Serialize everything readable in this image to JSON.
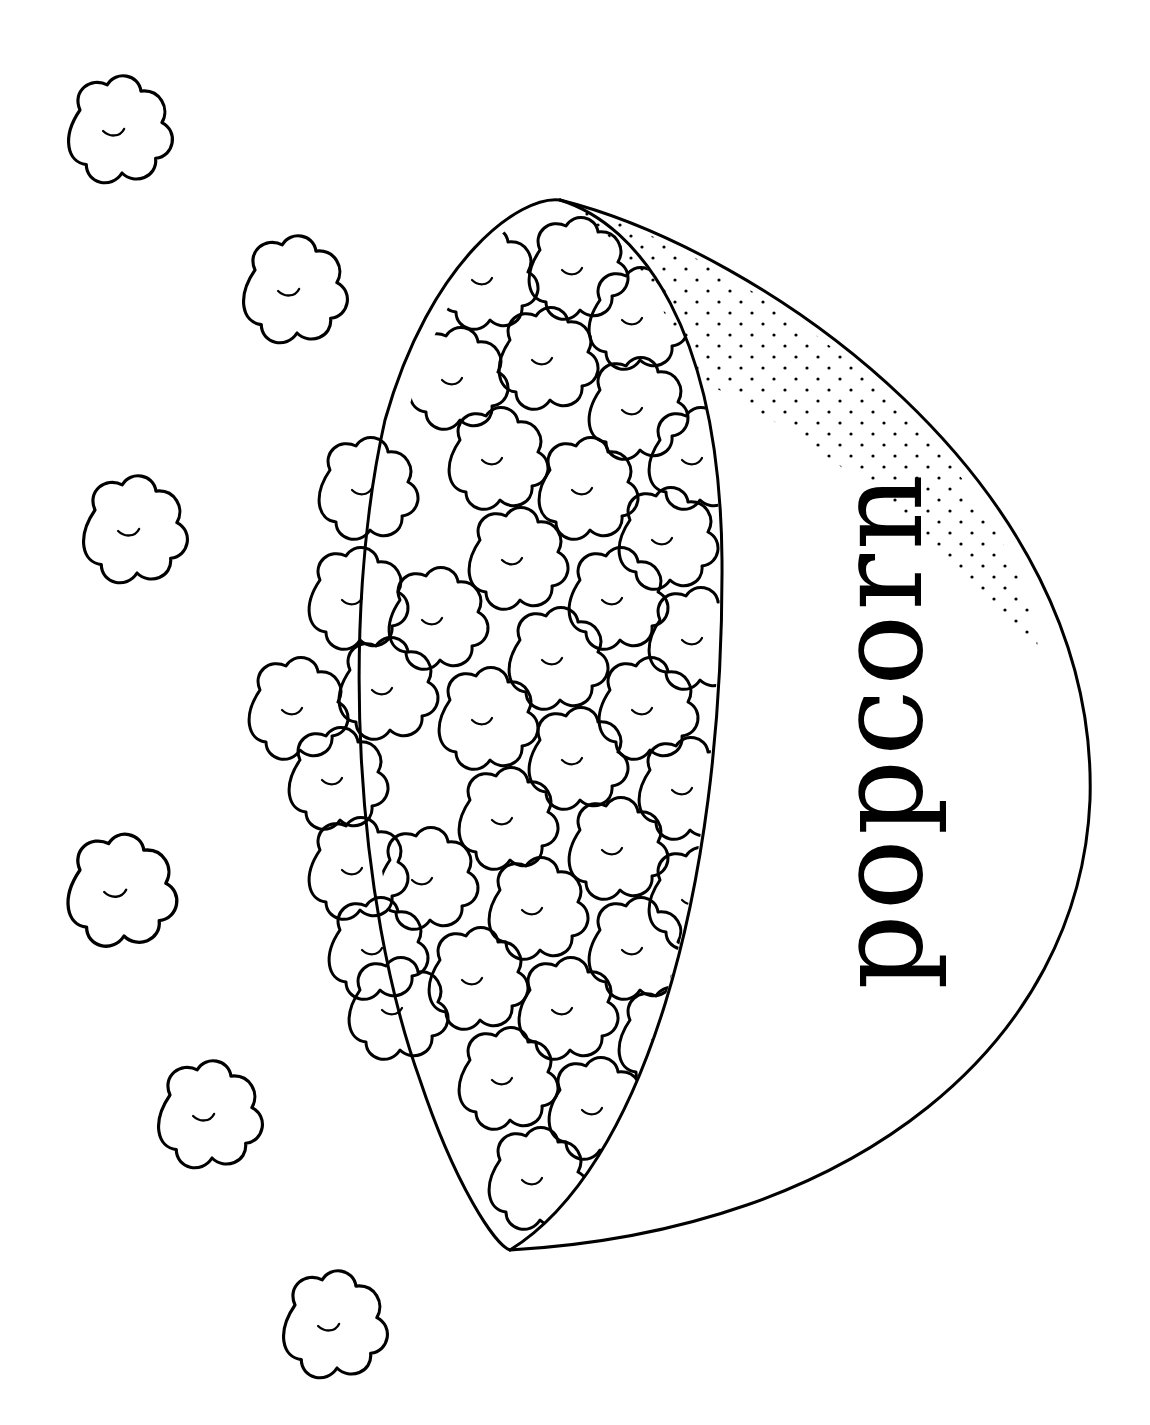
{
  "image": {
    "kind": "coloring-page",
    "subject": "bowl of popcorn",
    "orientation": "rotated 90 degrees counter-clockwise",
    "bowl_label": "popcorn",
    "loose_kernels_count": 6,
    "colors": {
      "ink": "#000000",
      "paper": "#ffffff"
    }
  }
}
